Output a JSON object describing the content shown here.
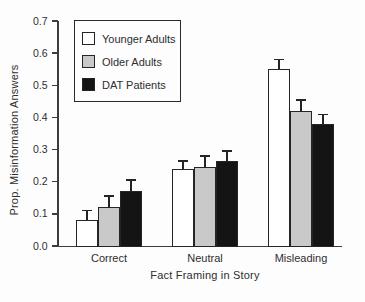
{
  "chart_data": {
    "type": "bar",
    "title": "",
    "xlabel": "Fact Framing in Story",
    "ylabel": "Prop. Misinformation Answers",
    "categories": [
      "Correct",
      "Neutral",
      "Misleading"
    ],
    "series": [
      {
        "name": "Younger Adults",
        "color": "#ffffff",
        "values": [
          0.08,
          0.24,
          0.55
        ],
        "errors": [
          0.03,
          0.025,
          0.03
        ]
      },
      {
        "name": "Older Adults",
        "color": "#c9c9c9",
        "values": [
          0.12,
          0.245,
          0.42
        ],
        "errors": [
          0.035,
          0.035,
          0.035
        ]
      },
      {
        "name": "DAT Patients",
        "color": "#141414",
        "values": [
          0.17,
          0.265,
          0.38
        ],
        "errors": [
          0.035,
          0.03,
          0.03
        ]
      }
    ],
    "ylim": [
      0,
      0.7
    ],
    "yticks": [
      "0.0",
      "0.1",
      "0.2",
      "0.3",
      "0.4",
      "0.5",
      "0.6",
      "0.7"
    ],
    "legend_position": "upper-left",
    "grid": false,
    "error_bars": "upper",
    "axis_color": "#3c3c3c"
  }
}
